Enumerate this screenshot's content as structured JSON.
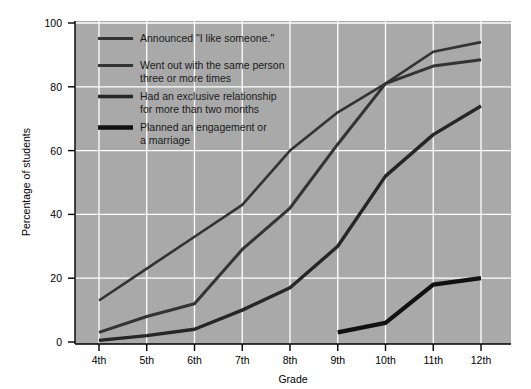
{
  "chart_data": {
    "type": "line",
    "title": "",
    "xlabel": "Grade",
    "ylabel": "Percentage of students",
    "categories": [
      "4th",
      "5th",
      "6th",
      "7th",
      "8th",
      "9th",
      "10th",
      "11th",
      "12th"
    ],
    "xlim": [
      0,
      8
    ],
    "ylim": [
      0,
      100
    ],
    "yticks": [
      0,
      20,
      40,
      60,
      80,
      100
    ],
    "ytick_labels": [
      "0",
      "20",
      "40",
      "60",
      "80",
      "100"
    ],
    "grid": true,
    "grid_color": "#ffffff",
    "plot_background": "#a9a9a9",
    "legend_position": "upper-left",
    "series": [
      {
        "name": "Announced \"I like someone.\"",
        "color": "#333333",
        "line_width": 2.6,
        "values": [
          13,
          23,
          33,
          43,
          60,
          72,
          81,
          91,
          94
        ]
      },
      {
        "name": "Went out with the same person three or more times",
        "color": "#333333",
        "line_width": 3.0,
        "values": [
          3,
          8,
          12,
          29,
          42,
          62,
          81,
          86.5,
          88.5
        ]
      },
      {
        "name": "Had an exclusive relationship for more than two months",
        "color": "#262626",
        "line_width": 3.4,
        "values": [
          0.5,
          2,
          4,
          10,
          17,
          30,
          52,
          65,
          74
        ]
      },
      {
        "name": "Planned an engagement or a marriage",
        "color": "#111111",
        "line_width": 4.2,
        "values": [
          null,
          null,
          null,
          null,
          null,
          3,
          6,
          18,
          20
        ]
      }
    ]
  },
  "legend": {
    "entries": [
      {
        "label_line1": "Announced \"I like someone.\"",
        "label_line2": ""
      },
      {
        "label_line1": "Went out with the same person",
        "label_line2": "three or more times"
      },
      {
        "label_line1": "Had an exclusive relationship",
        "label_line2": "for more than two months"
      },
      {
        "label_line1": "Planned an engagement or",
        "label_line2": "a marriage"
      }
    ]
  },
  "axes": {
    "y_title": "Percentage of students",
    "x_title": "Grade",
    "y_tick_labels": [
      "100",
      "80",
      "60",
      "40",
      "20",
      "0"
    ],
    "x_tick_labels": [
      "4th",
      "5th",
      "6th",
      "7th",
      "8th",
      "9th",
      "10th",
      "11th",
      "12th"
    ]
  }
}
